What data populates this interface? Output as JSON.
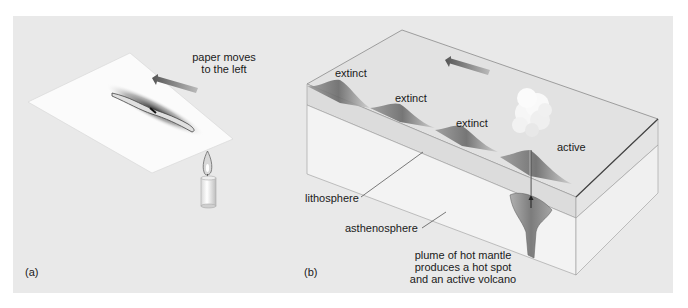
{
  "figure": {
    "background": "#e9e9e9",
    "panel_a": {
      "label": "(a)",
      "caption_line1": "paper moves",
      "caption_line2": "to the left",
      "icons": [
        "paper-sheet",
        "burn-mark",
        "left-arrow",
        "candle"
      ]
    },
    "panel_b": {
      "label": "(b)",
      "volcanoes": [
        {
          "label": "extinct"
        },
        {
          "label": "extinct"
        },
        {
          "label": "extinct"
        },
        {
          "label": "active"
        }
      ],
      "layers": {
        "lithosphere": "lithosphere",
        "asthenosphere": "asthenosphere"
      },
      "plume_caption_line1": "plume of hot mantle",
      "plume_caption_line2": "produces a hot spot",
      "plume_caption_line3": "and an active volcano",
      "icons": [
        "plate-block",
        "left-arrow",
        "volcano-cone",
        "eruption-cloud",
        "mantle-plume",
        "up-arrow"
      ]
    }
  }
}
